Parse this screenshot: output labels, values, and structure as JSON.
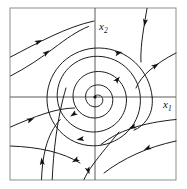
{
  "figure": {
    "title": "",
    "kind": "phase-portrait",
    "frame": {
      "x": 10,
      "y": 8,
      "width": 166,
      "height": 172,
      "stroke": "#8d8d8d"
    },
    "axes": {
      "origin_x": 95,
      "origin_y": 97,
      "stroke": "#5a5a5a",
      "horizontal_label": "x",
      "horizontal_subscript": "1",
      "vertical_label": "x",
      "vertical_subscript": "2",
      "horizontal_label_x": 163,
      "horizontal_label_y": 108,
      "vertical_label_x": 99,
      "vertical_label_y": 30
    },
    "equilibrium": {
      "name": "unstable-spiral",
      "x": 95,
      "y": 97,
      "radius": 1.6
    },
    "flow": {
      "direction": "counterclockwise",
      "stability": "unstable-outward",
      "stroke": "#1d1d1d"
    }
  },
  "chart_data": {
    "type": "line",
    "title": "",
    "xlabel": "x1",
    "ylabel": "x2",
    "grid": false,
    "legend": null,
    "xlim": [
      10,
      176
    ],
    "ylim": [
      180,
      8
    ],
    "series": [
      {
        "name": "spiral-inner-turn-1",
        "path": "M 95.3 95.6 C 98.6 94.0 101.8 95.6 102.6 98.6 C 103.6 102.6 100.6 106.4 96.2 106.8 C 90.6 107.3 86.0 103.2 85.6 97.4 C 85.1 90.6 90.3 85.2 97.4 84.9 C 105.8 84.6 112.6 91.0 112.8 99.6 C 113.1 109.6 105.2 117.8 94.8 118.0 C 82.8 118.3 73.0 108.6 73.0 96.3 C 73.0 82.5 84.2 71.4 98.4 71.5 C 114.2 71.6 126.7 84.4 126.5 100.4"
      },
      {
        "name": "spiral-inner-turn-2",
        "path": "M 126.5 100.4 C 126.3 118.0 111.5 132.2 93.2 132.0 C 73.2 131.8 57.0 115.2 57.2 95.2 C 57.4 73.5 75.4 56.0 97.6 56.3 C 121.6 56.6 140.8 76.4 140.4 100.8 C 140.2 114.0 134.4 125.8 125.3 133.8"
      },
      {
        "name": "spiral-outer-turn",
        "path": "M 125.3 133.8 C 116.6 141.4 105.2 146.0 92.8 145.8 C 67.2 145.4 46.6 124.0 47.0 98.2 C 47.4 70.0 70.8 47.4 99.6 48.0 C 127.5 48.6 149.8 70.4 152.2 97.4"
      },
      {
        "name": "outflow-right-branch",
        "path": "M 152.2 97.4 C 153.0 106.2 151.0 114.0 146.5 120.2 C 143.0 125.0 138.6 128.4 134.0 130.2"
      },
      {
        "name": "separatrix-descending-left",
        "path": "M 119.0 132.0 C 110.0 143.0 100.0 155.0 93.4 164.0 C 89.0 170.0 86.0 175.0 84.0 179.5"
      },
      {
        "name": "separatrix-rising-up",
        "path": "M 66.0 88.0 C 62.0 101.0 58.5 118.0 56.0 136.0 C 54.0 151.0 52.8 166.0 52.2 179.5"
      },
      {
        "name": "separatrix-near-vertical-lower",
        "path": "M 41.5 179.5 C 41.8 170.0 43.0 158.0 45.6 148.0 C 48.6 136.5 53.4 127.0 60.2 119.5"
      },
      {
        "name": "stream-upper-left",
        "path": "M 10.5 57.0 C 24.0 50.0 38.0 42.5 52.0 36.0 C 66.0 29.5 80.0 24.0 94.0 21.0"
      },
      {
        "name": "stream-upper-left-inner",
        "path": "M 10.5 76.0 C 26.0 68.0 41.0 58.0 54.0 48.0 C 66.0 39.0 77.0 31.0 88.5 26.5"
      },
      {
        "name": "stream-upper-right-top",
        "path": "M 147.0 8.5 C 145.0 20.0 143.0 32.0 141.8 42.0 C 141.0 50.0 140.6 57.0 141.0 62.0"
      },
      {
        "name": "stream-upper-right-outer",
        "path": "M 176.0 53.0 C 166.0 58.0 157.0 64.0 150.0 70.0 C 143.5 75.6 138.6 81.6 136.0 88.0"
      },
      {
        "name": "stream-lower-left",
        "path": "M 10.5 127.0 C 22.0 122.0 34.0 117.0 45.0 113.5 C 56.0 110.0 66.0 108.0 74.5 108.0"
      },
      {
        "name": "stream-lower-right",
        "path": "M 176.0 141.0 C 162.0 144.0 148.0 148.5 136.0 154.0 C 124.0 159.5 113.0 166.0 104.0 173.0"
      },
      {
        "name": "stream-lower-mid-right",
        "path": "M 176.0 119.5 C 160.0 121.0 144.0 124.0 131.0 128.5 C 119.0 132.6 109.0 138.0 101.0 144.5"
      },
      {
        "name": "stream-bottom-left",
        "path": "M 10.5 146.0 C 24.0 146.5 38.0 148.0 50.0 151.0 C 62.0 154.0 72.0 158.0 80.0 163.0"
      }
    ],
    "arrows": [
      {
        "name": "arrow-upper-left-stream",
        "x": 38,
        "y": 42,
        "angle": -26
      },
      {
        "name": "arrow-upper-left-inner",
        "x": 46,
        "y": 53,
        "angle": -38
      },
      {
        "name": "arrow-upper-right-outer",
        "x": 155,
        "y": 66,
        "angle": -34
      },
      {
        "name": "arrow-upper-right-top",
        "x": 145,
        "y": 22,
        "angle": 100
      },
      {
        "name": "arrow-spiral-upper-right",
        "x": 117,
        "y": 80,
        "angle": -52
      },
      {
        "name": "arrow-spiral-top",
        "x": 118,
        "y": 53,
        "angle": -14
      },
      {
        "name": "arrow-spiral-lower-left",
        "x": 74,
        "y": 114,
        "angle": 146
      },
      {
        "name": "arrow-spiral-bottom",
        "x": 81,
        "y": 139,
        "angle": 172
      },
      {
        "name": "arrow-lower-left-stream",
        "x": 30,
        "y": 120,
        "angle": -22
      },
      {
        "name": "arrow-lower-right-stream",
        "x": 148,
        "y": 148,
        "angle": 155
      },
      {
        "name": "arrow-lower-mid-right",
        "x": 133,
        "y": 127,
        "angle": 160
      },
      {
        "name": "arrow-bottom-left-stream",
        "x": 76,
        "y": 160,
        "angle": 150
      },
      {
        "name": "arrow-near-vertical-lower",
        "x": 42,
        "y": 162,
        "angle": -96
      },
      {
        "name": "arrow-separatrix-descending",
        "x": 88,
        "y": 170,
        "angle": 72
      }
    ]
  }
}
